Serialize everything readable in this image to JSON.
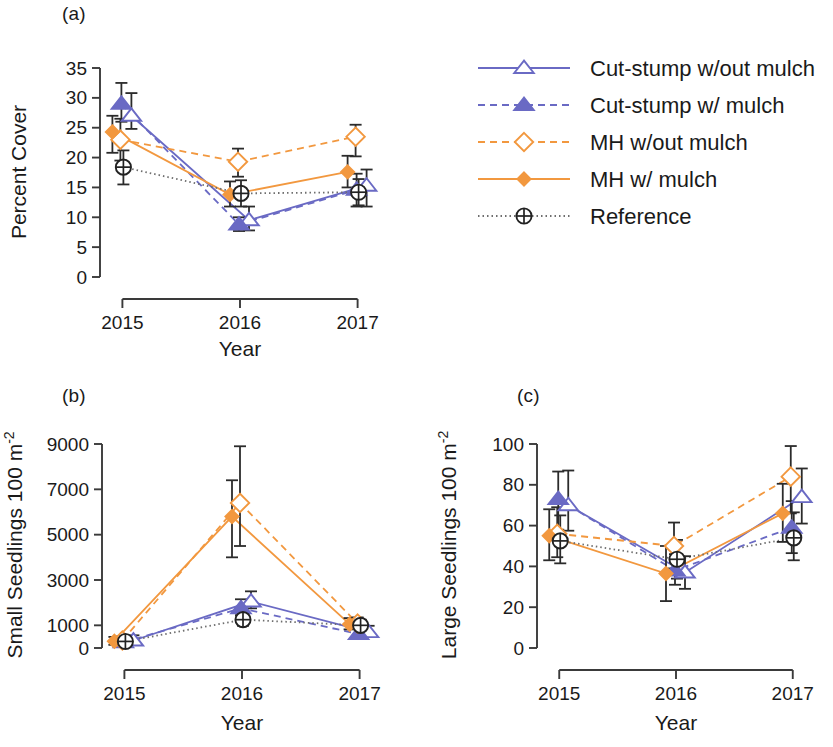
{
  "figure": {
    "panels": [
      "(a)",
      "(b)",
      "(c)"
    ],
    "xlabel": "Year",
    "categories": [
      "2015",
      "2016",
      "2017"
    ]
  },
  "legend": {
    "items": [
      {
        "label": "Cut-stump w/out mulch",
        "color": "#6a6ac4",
        "dash": "solid",
        "marker": "triangle-open"
      },
      {
        "label": "Cut-stump w/ mulch",
        "color": "#6a6ac4",
        "dash": "dashed",
        "marker": "triangle-filled"
      },
      {
        "label": "MH w/out mulch",
        "color": "#f2983f",
        "dash": "dashed",
        "marker": "diamond-open"
      },
      {
        "label": "MH w/ mulch",
        "color": "#f2983f",
        "dash": "solid",
        "marker": "diamond-filled"
      },
      {
        "label": "Reference",
        "color": "#4d4d4d",
        "dash": "dotted",
        "marker": "circle-plus"
      }
    ]
  },
  "chart_data": [
    {
      "panel": "(a)",
      "type": "line",
      "title": "",
      "xlabel": "Year",
      "ylabel": "Percent Cover",
      "categories": [
        "2015",
        "2016",
        "2017"
      ],
      "x": [
        2015,
        2016,
        2017
      ],
      "ylim": [
        0,
        35
      ],
      "yticks": [
        0,
        5,
        10,
        15,
        20,
        25,
        30,
        35
      ],
      "grid": false,
      "legend_position": "outside-right-top",
      "series": [
        {
          "name": "Cut-stump w/out mulch",
          "values": [
            27.0,
            9.5,
            15.3
          ],
          "err_low": [
            24.8,
            7.8,
            11.8
          ],
          "err_high": [
            30.8,
            11.8,
            18.0
          ]
        },
        {
          "name": "Cut-stump w/ mulch",
          "values": [
            29.0,
            8.8,
            14.6
          ],
          "err_low": [
            26.0,
            7.7,
            11.8
          ],
          "err_high": [
            32.5,
            10.0,
            17.3
          ]
        },
        {
          "name": "MH w/out mulch",
          "values": [
            23.0,
            19.3,
            23.5
          ],
          "err_low": [
            19.5,
            16.8,
            20.2
          ],
          "err_high": [
            26.5,
            21.5,
            25.5
          ]
        },
        {
          "name": "MH w/ mulch",
          "values": [
            24.3,
            13.8,
            17.6
          ],
          "err_low": [
            20.8,
            11.8,
            15.0
          ],
          "err_high": [
            27.0,
            16.0,
            20.3
          ]
        },
        {
          "name": "Reference",
          "values": [
            18.4,
            14.0,
            14.2
          ],
          "err_low": [
            15.5,
            11.8,
            12.0
          ],
          "err_high": [
            21.2,
            16.2,
            16.4
          ]
        }
      ]
    },
    {
      "panel": "(b)",
      "type": "line",
      "title": "",
      "xlabel": "Year",
      "ylabel": "Small Seedlings 100 m -2",
      "categories": [
        "2015",
        "2016",
        "2017"
      ],
      "x": [
        2015,
        2016,
        2017
      ],
      "ylim": [
        0,
        9000
      ],
      "yticks": [
        0,
        1000,
        3000,
        5000,
        7000,
        9000
      ],
      "grid": false,
      "series": [
        {
          "name": "Cut-stump w/out mulch",
          "values": [
            330,
            2050,
            700
          ],
          "err_low": [
            150,
            1750,
            500
          ],
          "err_high": [
            560,
            2500,
            980
          ]
        },
        {
          "name": "Cut-stump w/ mulch",
          "values": [
            250,
            1750,
            620
          ],
          "err_low": [
            110,
            1450,
            430
          ],
          "err_high": [
            450,
            2150,
            880
          ]
        },
        {
          "name": "MH w/out mulch",
          "values": [
            330,
            6400,
            1080
          ],
          "err_low": [
            150,
            4500,
            850
          ],
          "err_high": [
            520,
            8900,
            1350
          ]
        },
        {
          "name": "MH w/ mulch",
          "values": [
            300,
            5800,
            1050
          ],
          "err_low": [
            140,
            4000,
            820
          ],
          "err_high": [
            490,
            7400,
            1320
          ]
        },
        {
          "name": "Reference",
          "values": [
            290,
            1250,
            1000
          ],
          "err_low": [
            140,
            980,
            790
          ],
          "err_high": [
            470,
            1520,
            1250
          ]
        }
      ]
    },
    {
      "panel": "(c)",
      "type": "line",
      "title": "",
      "xlabel": "Year",
      "ylabel": "Large Seedlings 100 m -2",
      "categories": [
        "2015",
        "2016",
        "2017"
      ],
      "x": [
        2015,
        2016,
        2017
      ],
      "ylim": [
        0,
        100
      ],
      "yticks": [
        0,
        20,
        40,
        60,
        80,
        100
      ],
      "grid": false,
      "series": [
        {
          "name": "Cut-stump w/out mulch",
          "values": [
            70.0,
            37.0,
            74.0
          ],
          "err_low": [
            57.5,
            29.0,
            61.0
          ],
          "err_high": [
            87.0,
            45.0,
            88.0
          ]
        },
        {
          "name": "Cut-stump w/ mulch",
          "values": [
            73.0,
            38.0,
            59.0
          ],
          "err_low": [
            58.0,
            31.0,
            46.5
          ],
          "err_high": [
            86.5,
            46.0,
            72.0
          ]
        },
        {
          "name": "MH w/out mulch",
          "values": [
            56.0,
            50.0,
            84.0
          ],
          "err_low": [
            44.5,
            39.0,
            66.0
          ],
          "err_high": [
            69.0,
            61.5,
            99.0
          ]
        },
        {
          "name": "MH w/ mulch",
          "values": [
            55.0,
            36.5,
            66.0
          ],
          "err_low": [
            43.0,
            23.0,
            52.0
          ],
          "err_high": [
            68.0,
            50.0,
            80.5
          ]
        },
        {
          "name": "Reference",
          "values": [
            52.5,
            43.5,
            54.0
          ],
          "err_low": [
            41.5,
            34.0,
            43.0
          ],
          "err_high": [
            65.0,
            53.0,
            66.5
          ]
        }
      ]
    }
  ]
}
